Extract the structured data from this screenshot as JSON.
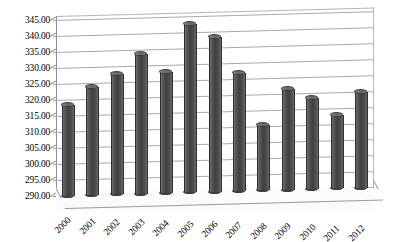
{
  "chart_data": {
    "type": "bar",
    "title": "",
    "subtitle": "",
    "xlabel": "",
    "ylabel": "",
    "ylim": [
      290.0,
      345.0
    ],
    "y_tick_step": 5.0,
    "y_ticks": [
      "345.00",
      "340.00",
      "335.00",
      "330.00",
      "325.00",
      "320.00",
      "315.00",
      "310.00",
      "305.00",
      "300.00",
      "295.00",
      "290.00"
    ],
    "y_tick_values": [
      345.0,
      340.0,
      335.0,
      330.0,
      325.0,
      320.0,
      315.0,
      310.0,
      305.0,
      300.0,
      295.0,
      290.0
    ],
    "grid": true,
    "grid_axis": "y",
    "legend": false,
    "legend_position": "none",
    "style": "3d-cylinder",
    "bar_color": "#454545",
    "grid_color": "#a8a8a8",
    "background_color": "#ffffff",
    "categories": [
      "2000",
      "2001",
      "2002",
      "2003",
      "2004",
      "2005",
      "2006",
      "2007",
      "2008",
      "2009",
      "2010",
      "2011",
      "2012"
    ],
    "values": [
      319.3,
      324.6,
      328.6,
      334.7,
      328.8,
      343.6,
      339.3,
      327.8,
      311.5,
      322.3,
      319.5,
      314.0,
      320.9
    ],
    "x_tick_rotation": -45,
    "annotations": []
  }
}
